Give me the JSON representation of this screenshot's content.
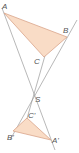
{
  "diagram": {
    "type": "point-reflection / central similarity of triangles",
    "colors": {
      "fill": "#f9dcc6",
      "edge": "#d9a58a",
      "line": "#9a9a9a",
      "label": "#555555"
    },
    "points": {
      "A": {
        "label": "A",
        "x": 4,
        "y": 13
      },
      "B": {
        "label": "B",
        "x": 67,
        "y": 37
      },
      "C": {
        "label": "C",
        "x": 44,
        "y": 57
      },
      "S": {
        "label": "S",
        "x": 33,
        "y": 96
      },
      "A1": {
        "label": "A'",
        "x": 51,
        "y": 140
      },
      "B1": {
        "label": "B'",
        "x": 13,
        "y": 131
      },
      "C1": {
        "label": "C'",
        "x": 27,
        "y": 118
      }
    },
    "triangles": [
      {
        "name": "ABC",
        "vertices": [
          "A",
          "B",
          "C"
        ]
      },
      {
        "name": "A'B'C'",
        "vertices": [
          "A'",
          "B'",
          "C'"
        ]
      }
    ],
    "lines": [
      "AA'",
      "BB'",
      "CC'"
    ],
    "center": "S"
  }
}
